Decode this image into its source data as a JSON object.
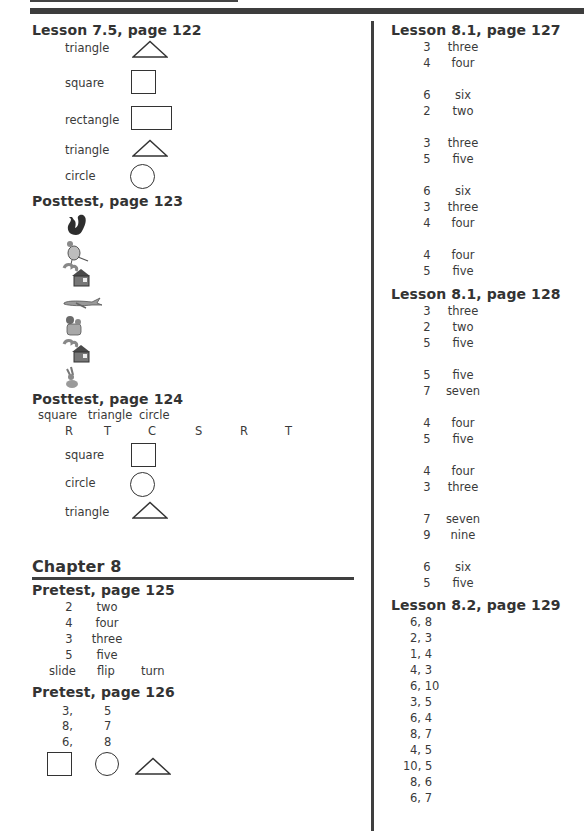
{
  "left_column": {
    "lesson_7_5": {
      "title": "Lesson 7.5, page 122",
      "items": [
        {
          "label": "triangle",
          "shape": "triangle"
        },
        {
          "label": "square",
          "shape": "square"
        },
        {
          "label": "rectangle",
          "shape": "rectangle"
        },
        {
          "label": "triangle",
          "shape": "triangle"
        },
        {
          "label": "circle",
          "shape": "circle"
        }
      ]
    },
    "posttest_123": {
      "title": "Posttest, page 123",
      "pictures": [
        "squirrel-icon",
        "bird-icon",
        "house-icon",
        "airplane-icon",
        "dog-icon",
        "house-icon",
        "rabbit-icon"
      ]
    },
    "posttest_124": {
      "title": "Posttest, page 124",
      "shape_words": [
        "square",
        "triangle",
        "circle"
      ],
      "letters": [
        "R",
        "T",
        "C",
        "S",
        "R",
        "T"
      ],
      "items": [
        {
          "label": "square",
          "shape": "square"
        },
        {
          "label": "circle",
          "shape": "circle"
        },
        {
          "label": "triangle",
          "shape": "triangle"
        }
      ]
    },
    "chapter": {
      "title": "Chapter 8"
    },
    "pretest_125": {
      "title": "Pretest, page 125",
      "rows": [
        {
          "num": "2",
          "word": "two"
        },
        {
          "num": "4",
          "word": "four"
        },
        {
          "num": "3",
          "word": "three"
        },
        {
          "num": "5",
          "word": "five"
        }
      ],
      "moves": [
        "slide",
        "flip",
        "turn"
      ]
    },
    "pretest_126": {
      "title": "Pretest, page 126",
      "rows": [
        {
          "a": "3,",
          "b": "5"
        },
        {
          "a": "8,",
          "b": "7"
        },
        {
          "a": "6,",
          "b": "8"
        }
      ],
      "shapes": [
        "square",
        "circle",
        "triangle"
      ]
    }
  },
  "right_column": {
    "lesson_8_1_127": {
      "title": "Lesson 8.1, page 127",
      "groups": [
        [
          {
            "num": "3",
            "word": "three"
          },
          {
            "num": "4",
            "word": "four"
          }
        ],
        [
          {
            "num": "6",
            "word": "six"
          },
          {
            "num": "2",
            "word": "two"
          }
        ],
        [
          {
            "num": "3",
            "word": "three"
          },
          {
            "num": "5",
            "word": "five"
          }
        ],
        [
          {
            "num": "6",
            "word": "six"
          },
          {
            "num": "3",
            "word": "three"
          },
          {
            "num": "4",
            "word": "four"
          }
        ],
        [
          {
            "num": "4",
            "word": "four"
          },
          {
            "num": "5",
            "word": "five"
          }
        ]
      ]
    },
    "lesson_8_1_128": {
      "title": "Lesson 8.1, page 128",
      "groups": [
        [
          {
            "num": "3",
            "word": "three"
          },
          {
            "num": "2",
            "word": "two"
          },
          {
            "num": "5",
            "word": "five"
          }
        ],
        [
          {
            "num": "5",
            "word": "five"
          },
          {
            "num": "7",
            "word": "seven"
          }
        ],
        [
          {
            "num": "4",
            "word": "four"
          },
          {
            "num": "5",
            "word": "five"
          }
        ],
        [
          {
            "num": "4",
            "word": "four"
          },
          {
            "num": "3",
            "word": "three"
          }
        ],
        [
          {
            "num": "7",
            "word": "seven"
          },
          {
            "num": "9",
            "word": "nine"
          }
        ],
        [
          {
            "num": "6",
            "word": "six"
          },
          {
            "num": "5",
            "word": "five"
          }
        ]
      ]
    },
    "lesson_8_2_129": {
      "title": "Lesson 8.2, page 129",
      "pairs": [
        "6, 8",
        "2, 3",
        "1, 4",
        "4, 3",
        "6, 10",
        "3, 5",
        "6, 4",
        "8, 7",
        "4, 5",
        "10, 5",
        "8, 6",
        "6, 7"
      ]
    }
  }
}
